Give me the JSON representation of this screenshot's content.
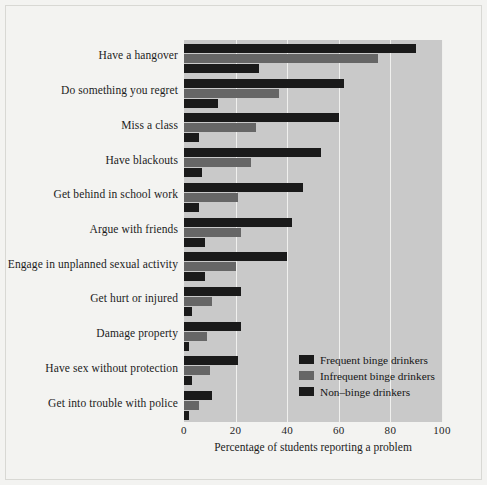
{
  "chart_data": {
    "type": "bar",
    "orientation": "horizontal",
    "title": "",
    "xlabel": "Percentage of students reporting a problem",
    "ylabel": "",
    "xlim": [
      0,
      100
    ],
    "xticks": [
      0,
      20,
      40,
      60,
      80,
      100
    ],
    "grid": true,
    "legend_position": "inside-lower-right",
    "categories": [
      "Have a hangover",
      "Do something you regret",
      "Miss a class",
      "Have blackouts",
      "Get behind in school work",
      "Argue with friends",
      "Engage in unplanned sexual activity",
      "Get hurt or injured",
      "Damage property",
      "Have sex without protection",
      "Get into trouble with police"
    ],
    "series": [
      {
        "name": "Frequent binge drinkers",
        "color": "#1a1a1a",
        "values": [
          90,
          62,
          60,
          53,
          46,
          42,
          40,
          22,
          22,
          21,
          11
        ]
      },
      {
        "name": "Infrequent binge drinkers",
        "color": "#666666",
        "values": [
          75,
          37,
          28,
          26,
          21,
          22,
          20,
          11,
          9,
          10,
          6
        ]
      },
      {
        "name": "Non–binge drinkers",
        "color": "#1a1a1a",
        "values": [
          29,
          13,
          6,
          7,
          6,
          8,
          8,
          3,
          2,
          3,
          2
        ]
      }
    ]
  },
  "axis": {
    "tick_labels": [
      "0",
      "20",
      "40",
      "60",
      "80",
      "100"
    ]
  },
  "legend": {
    "items": [
      {
        "label": "Frequent binge drinkers",
        "color": "#1a1a1a"
      },
      {
        "label": "Infrequent binge drinkers",
        "color": "#666666"
      },
      {
        "label": "Non–binge drinkers",
        "color": "#1a1a1a"
      }
    ]
  },
  "colors": {
    "page_background": "#f3f3f1",
    "plot_background": "#c9c9c9",
    "gridline": "#f0f0ee",
    "frequent": "#1a1a1a",
    "infrequent": "#666666",
    "nonbinge": "#1a1a1a"
  }
}
